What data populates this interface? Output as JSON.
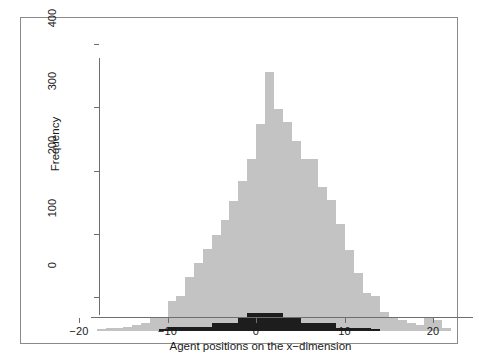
{
  "chart_data": {
    "type": "bar",
    "title": "",
    "subtitle": "",
    "xlabel": "Agent positions on the x−dimension",
    "ylabel": "Frequency",
    "xlim": [
      -21.5,
      22.5
    ],
    "ylim": [
      0,
      425
    ],
    "xticks": [
      -20,
      -10,
      0,
      10,
      20
    ],
    "xticklabels": [
      "-20",
      "-10",
      "0",
      "10",
      "20"
    ],
    "yticks": [
      0,
      100,
      200,
      300,
      400
    ],
    "yticklabels": [
      "0",
      "100",
      "200",
      "300",
      "400"
    ],
    "grid": false,
    "legend": "none",
    "bin_width": 1,
    "overlay": "two overlaid histograms, light gray behind, black in front",
    "series": [
      {
        "name": "gray-histogram",
        "color": "#c3c3c3",
        "bin_starts": [
          -18,
          -17,
          -16,
          -15,
          -14,
          -13,
          -12,
          -11,
          -10,
          -9,
          -8,
          -7,
          -6,
          -5,
          -4,
          -3,
          -2,
          -1,
          0,
          1,
          2,
          3,
          4,
          5,
          6,
          7,
          8,
          9,
          10,
          11,
          12,
          13,
          14,
          15,
          16,
          17,
          18,
          19,
          20,
          21
        ],
        "values": [
          3,
          5,
          5,
          7,
          10,
          12,
          20,
          22,
          48,
          55,
          85,
          108,
          130,
          152,
          175,
          205,
          238,
          272,
          327,
          410,
          352,
          330,
          300,
          272,
          272,
          228,
          208,
          170,
          128,
          92,
          60,
          55,
          30,
          22,
          18,
          12,
          10,
          20,
          18,
          4
        ]
      },
      {
        "name": "black-histogram",
        "color": "#1d1d1d",
        "bin_starts": [
          -11,
          -10,
          -9,
          -8,
          -7,
          -6,
          -5,
          -4,
          -3,
          -2,
          -1,
          0,
          1,
          2,
          3,
          4,
          5,
          6,
          7,
          8,
          9,
          10,
          11,
          12,
          13
        ],
        "values": [
          3,
          6,
          6,
          6,
          6,
          7,
          12,
          13,
          13,
          20,
          29,
          29,
          29,
          29,
          22,
          22,
          13,
          12,
          12,
          12,
          5,
          5,
          5,
          5,
          3
        ]
      }
    ]
  },
  "axis": {
    "x_label": "Agent positions on the x−dimension",
    "y_label": "Frequency"
  }
}
